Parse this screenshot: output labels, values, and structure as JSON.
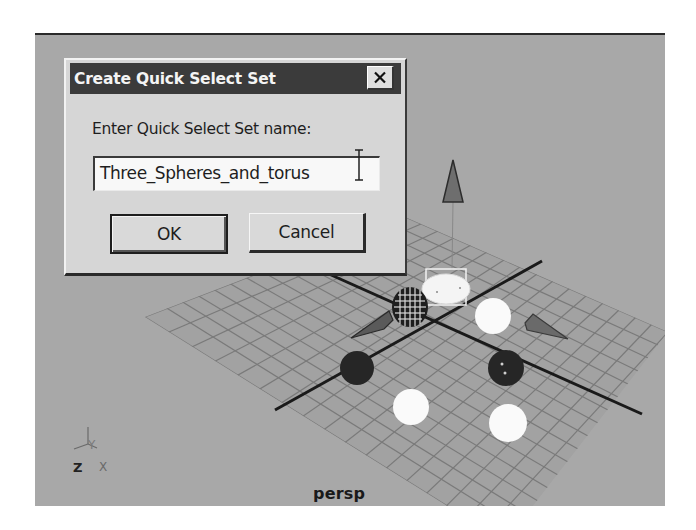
{
  "dialog": {
    "title": "Create Quick Select Set",
    "close_icon": "close-icon",
    "prompt_label": "Enter Quick Select Set name:",
    "name_field": {
      "value": "Three_Spheres_and_torus",
      "cursor": "i-beam-cursor"
    },
    "buttons": {
      "ok_label": "OK",
      "cancel_label": "Cancel"
    }
  },
  "viewport": {
    "camera_label": "persp",
    "axis_indicator": {
      "z": "Z",
      "x": "X",
      "y": "Y"
    },
    "scene_objects": [
      {
        "type": "cone",
        "name": "top-cone"
      },
      {
        "type": "cone",
        "name": "left-cone"
      },
      {
        "type": "cone",
        "name": "right-cone"
      },
      {
        "type": "cylinder",
        "name": "wireframe-cylinder",
        "display": "wireframe"
      },
      {
        "type": "torus",
        "name": "selected-torus",
        "state": "selected"
      },
      {
        "type": "sphere",
        "name": "white-sphere-1",
        "state": "selected"
      },
      {
        "type": "sphere",
        "name": "white-sphere-2",
        "state": "selected"
      },
      {
        "type": "sphere",
        "name": "white-sphere-3",
        "state": "selected"
      },
      {
        "type": "sphere",
        "name": "dark-sphere-1",
        "state": "unselected"
      },
      {
        "type": "sphere",
        "name": "dark-sphere-2",
        "state": "unselected"
      }
    ]
  },
  "colors": {
    "viewport_bg": "#a8a8a8",
    "grid_line": "#7c7c7c",
    "dialog_bg": "#d6d6d6",
    "titlebar_bg": "#3b3b3b",
    "selected_object": "#f6f6f6",
    "unselected_object": "#2a2a2a"
  }
}
